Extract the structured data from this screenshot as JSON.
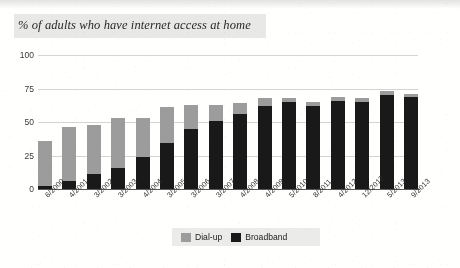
{
  "title": "% of adults who have internet access at home",
  "source_note": "Source: Broadband versus dialup by timeline 2000 TO 2013, Onlinemarketing.com",
  "legend": {
    "position": "bottom-center",
    "items": [
      {
        "label": "Dial-up",
        "color": "#9b9b9b",
        "swatch": "dialup-swatch"
      },
      {
        "label": "Broadband",
        "color": "#1b1b1b",
        "swatch": "broadband-swatch"
      }
    ]
  },
  "chart_data": {
    "type": "bar",
    "stacked": true,
    "title": "% of adults who have internet access at home",
    "xlabel": "",
    "ylabel": "",
    "ylim": [
      0,
      100
    ],
    "yticks": [
      0,
      25,
      50,
      75,
      100
    ],
    "grid": true,
    "categories": [
      "6/2000",
      "4/2001",
      "3/2002",
      "3/2003",
      "4/2004",
      "3/2005",
      "3/2006",
      "3/2007",
      "4/2008",
      "4/2009",
      "5/2010",
      "8/2011",
      "4/2012",
      "12/2012",
      "5/2013",
      "9/2013"
    ],
    "series": [
      {
        "name": "Broadband",
        "color": "#1b1b1b",
        "values": [
          2,
          6,
          11,
          16,
          24,
          34,
          45,
          51,
          56,
          62,
          65,
          62,
          66,
          65,
          70,
          69
        ]
      },
      {
        "name": "Dial-up",
        "color": "#9b9b9b",
        "values": [
          34,
          40,
          37,
          37,
          29,
          27,
          18,
          12,
          8,
          6,
          3,
          3,
          3,
          3,
          3,
          2
        ]
      }
    ],
    "totals": [
      36,
      46,
      48,
      53,
      53,
      61,
      63,
      63,
      64,
      68,
      68,
      65,
      69,
      68,
      73,
      71
    ]
  }
}
